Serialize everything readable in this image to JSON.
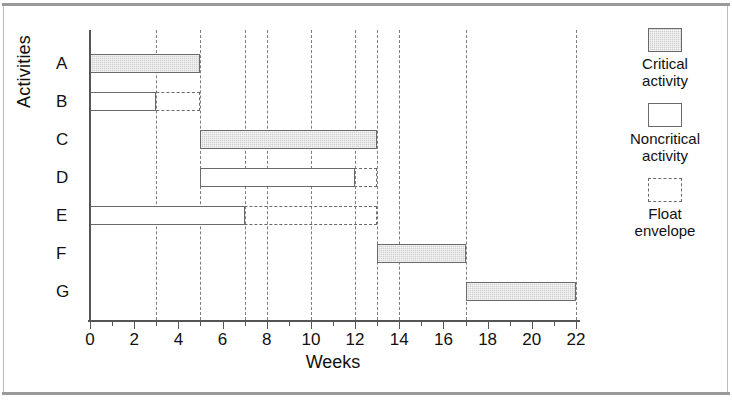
{
  "chart_data": {
    "type": "bar",
    "chart_kind": "gantt",
    "title": "",
    "xlabel": "Weeks",
    "ylabel": "Activities",
    "xlim": [
      0,
      22
    ],
    "xticks_major": [
      0,
      2,
      4,
      6,
      8,
      10,
      12,
      14,
      16,
      18,
      20,
      22
    ],
    "xtick_labels": [
      "0",
      "2",
      "4",
      "6",
      "8",
      "10",
      "12",
      "14",
      "16",
      "18",
      "20",
      "22"
    ],
    "xticks_minor": [
      1,
      3,
      5,
      7,
      9,
      11,
      13,
      15,
      17,
      19,
      21
    ],
    "grid": true,
    "gridlines": [
      3,
      5,
      7,
      8,
      10,
      12,
      13,
      14,
      17,
      22
    ],
    "categories": [
      "A",
      "B",
      "C",
      "D",
      "E",
      "F",
      "G"
    ],
    "bars": [
      {
        "activity": "A",
        "start": 0,
        "end": 5,
        "duration": 5,
        "type": "critical",
        "float_end": null
      },
      {
        "activity": "B",
        "start": 0,
        "end": 3,
        "duration": 3,
        "type": "noncritical",
        "float_end": 5
      },
      {
        "activity": "C",
        "start": 5,
        "end": 13,
        "duration": 8,
        "type": "critical",
        "float_end": null
      },
      {
        "activity": "D",
        "start": 5,
        "end": 12,
        "duration": 7,
        "type": "noncritical",
        "float_end": 13
      },
      {
        "activity": "E",
        "start": 0,
        "end": 7,
        "duration": 7,
        "type": "noncritical",
        "float_end": 13
      },
      {
        "activity": "F",
        "start": 13,
        "end": 17,
        "duration": 4,
        "type": "critical",
        "float_end": null
      },
      {
        "activity": "G",
        "start": 17,
        "end": 22,
        "duration": 5,
        "type": "critical",
        "float_end": null
      }
    ],
    "legend": {
      "position": "right",
      "entries": [
        {
          "swatch": "critical",
          "line1": "Critical",
          "line2": "activity"
        },
        {
          "swatch": "noncritical",
          "line1": "Noncritical",
          "line2": "activity"
        },
        {
          "swatch": "float",
          "line1": "Float",
          "line2": "envelope"
        }
      ]
    },
    "colors": {
      "critical_fill": "#cfcfcf",
      "bar_stroke": "#6a6a6a",
      "axis": "#555555",
      "gridline": "#7d7d7d",
      "background": "#ffffff"
    }
  }
}
